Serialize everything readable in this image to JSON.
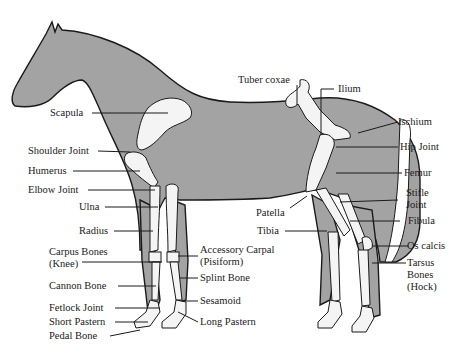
{
  "colors": {
    "body_fill": "#a3a3a3",
    "bone_fill": "#f4f4f4",
    "outline": "#1a1a1a",
    "background": "#ffffff"
  },
  "labels": {
    "scapula": "Scapula",
    "shoulder_joint": "Shoulder Joint",
    "humerus": "Humerus",
    "elbow_joint": "Elbow Joint",
    "ulna": "Ulna",
    "radius": "Radius",
    "carpus_bones_1": "Carpus Bones",
    "carpus_bones_2": "(Knee)",
    "cannon_bone": "Cannon Bone",
    "fetlock_joint": "Fetlock Joint",
    "short_pastern": "Short Pastern",
    "pedal_bone": "Pedal Bone",
    "accessory_carpal_1": "Accessory Carpal",
    "accessory_carpal_2": "(Pisiform)",
    "splint_bone": "Splint Bone",
    "sesamoid": "Sesamoid",
    "long_pastern": "Long Pastern",
    "tuber_coxae": "Tuber coxae",
    "ilium": "Ilium",
    "ischium": "Ischium",
    "hip_joint": "Hip Joint",
    "femur": "Femur",
    "stifle_joint_1": "Stifle",
    "stifle_joint_2": "Joint",
    "patella": "Patella",
    "tibia": "Tibia",
    "fibula": "Fibula",
    "os_calcis": "Os calcis",
    "tarsus_bones_1": "Tarsus",
    "tarsus_bones_2": "Bones",
    "tarsus_bones_3": "(Hock)"
  }
}
